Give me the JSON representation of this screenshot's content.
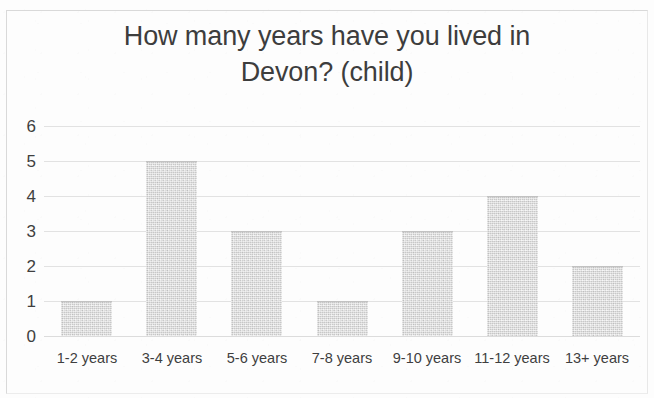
{
  "chart_data": {
    "type": "bar",
    "title": "How many years have you lived in Devon? (child)",
    "title_lines": "How many years have you lived in\nDevon? (child)",
    "xlabel": "",
    "ylabel": "",
    "categories": [
      "1-2 years",
      "3-4 years",
      "5-6 years",
      "7-8 years",
      "9-10 years",
      "11-12 years",
      "13+ years"
    ],
    "values": [
      1,
      5,
      3,
      1,
      3,
      4,
      2
    ],
    "ylim": [
      0,
      6
    ],
    "ytick_labels": [
      "6",
      "5",
      "4",
      "3",
      "2",
      "1",
      "0"
    ],
    "ytick_values": [
      6,
      5,
      4,
      3,
      2,
      1,
      0
    ],
    "grid": true,
    "legend": false,
    "bar_color": "#d6d6d6",
    "bar_edge_color": "#c2c2c2",
    "grid_color": "#e2e2e2",
    "text_color": "#3f3f3f",
    "title_color": "#3d3d3d",
    "frame_color": "#d9d9d9",
    "background_color": "#fdfdfd"
  }
}
